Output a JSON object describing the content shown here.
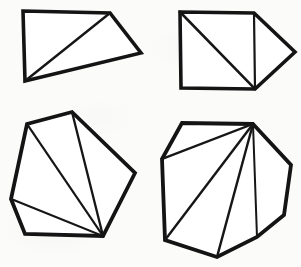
{
  "figure": {
    "background_color": "#fbfbfa",
    "ink_color": "#141414",
    "fill_color": "#ffffff",
    "canvas": {
      "width": 301,
      "height": 267
    },
    "shape_count": 4
  },
  "shapes": [
    {
      "id": "shape-1",
      "label": "quadrilateral-with-one-diagonal",
      "position": "top-left",
      "sides": 4,
      "triangles": 2,
      "outline_width": 3.6,
      "chord_width": 2.4,
      "outline_points": "23,11 110,13 141,53 25,81",
      "vertices": [
        {
          "name": "top-left",
          "x": 23,
          "y": 11
        },
        {
          "name": "top-right",
          "x": 110,
          "y": 13
        },
        {
          "name": "right",
          "x": 141,
          "y": 53
        },
        {
          "name": "bottom-left",
          "x": 25,
          "y": 81
        }
      ],
      "diagonals": [
        {
          "from": "bottom-left",
          "to": "top-right",
          "d": "M25,81 L110,13"
        }
      ]
    },
    {
      "id": "shape-2",
      "label": "square-with-attached-triangle",
      "position": "top-right",
      "sides": 5,
      "triangles": 3,
      "outline_width": 3.6,
      "chord_width": 2.6,
      "outline_points": "180,12 254,13 295,52 255,89 181,88",
      "vertices": [
        {
          "name": "top-left",
          "x": 180,
          "y": 12
        },
        {
          "name": "top-right",
          "x": 254,
          "y": 13
        },
        {
          "name": "point",
          "x": 295,
          "y": 52
        },
        {
          "name": "bottom-right",
          "x": 255,
          "y": 89
        },
        {
          "name": "bottom-left",
          "x": 181,
          "y": 88
        }
      ],
      "diagonals": [
        {
          "from": "top-left",
          "to": "bottom-right",
          "d": "M180,12 L255,89"
        },
        {
          "from": "top-right",
          "to": "bottom-right",
          "d": "M254,13 L255,89"
        }
      ]
    },
    {
      "id": "shape-3",
      "label": "hexagon-fan-from-bottom-right",
      "position": "bottom-left",
      "sides": 6,
      "triangles": 4,
      "outline_width": 3.8,
      "chord_width": 2.2,
      "outline_points": "72,112 135,173 103,236 25,234 11,199 27,124",
      "vertices": [
        {
          "name": "top",
          "x": 72,
          "y": 112
        },
        {
          "name": "right",
          "x": 135,
          "y": 173
        },
        {
          "name": "bottom-right-hub",
          "x": 103,
          "y": 236
        },
        {
          "name": "bottom-left",
          "x": 25,
          "y": 234
        },
        {
          "name": "left",
          "x": 11,
          "y": 199
        },
        {
          "name": "upper-left",
          "x": 27,
          "y": 124
        }
      ],
      "diagonals": [
        {
          "from": "bottom-right-hub",
          "to": "top",
          "d": "M103,236 L72,112"
        },
        {
          "from": "bottom-right-hub",
          "to": "upper-left",
          "d": "M103,236 L27,124"
        },
        {
          "from": "bottom-right-hub",
          "to": "left",
          "d": "M103,236 L11,199"
        }
      ]
    },
    {
      "id": "shape-4",
      "label": "heptagon-fan-from-top-right",
      "position": "bottom-right",
      "sides": 7,
      "triangles": 5,
      "outline_width": 3.8,
      "chord_width": 2.2,
      "outline_points": "253,124 291,165 284,215 257,237 217,257 165,240 162,159 182,123",
      "vertices": [
        {
          "name": "top-hub",
          "x": 253,
          "y": 124
        },
        {
          "name": "upper-right",
          "x": 291,
          "y": 165
        },
        {
          "name": "right",
          "x": 284,
          "y": 215
        },
        {
          "name": "bottom-right",
          "x": 257,
          "y": 237
        },
        {
          "name": "bottom",
          "x": 217,
          "y": 257
        },
        {
          "name": "bottom-left",
          "x": 165,
          "y": 240
        },
        {
          "name": "left",
          "x": 162,
          "y": 159
        },
        {
          "name": "top-left",
          "x": 182,
          "y": 123
        }
      ],
      "diagonals": [
        {
          "from": "top-hub",
          "to": "left",
          "d": "M253,124 L162,159"
        },
        {
          "from": "top-hub",
          "to": "bottom-left",
          "d": "M253,124 L165,240"
        },
        {
          "from": "top-hub",
          "to": "bottom",
          "d": "M253,124 L217,257"
        },
        {
          "from": "top-hub",
          "to": "bottom-right",
          "d": "M253,124 L257,237"
        }
      ]
    }
  ]
}
